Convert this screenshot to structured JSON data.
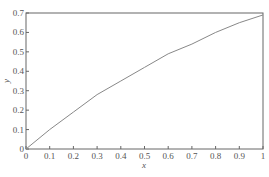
{
  "chart_data": {
    "type": "line",
    "title": "",
    "xlabel": "x",
    "ylabel": "y",
    "xlim": [
      0,
      1
    ],
    "ylim": [
      0,
      0.7
    ],
    "grid": false,
    "legend": null,
    "x_ticks": [
      "0",
      "0.1",
      "0.2",
      "0.3",
      "0.4",
      "0.5",
      "0.6",
      "0.7",
      "0.8",
      "0.9",
      "1"
    ],
    "y_ticks": [
      "0",
      "0.1",
      "0.2",
      "0.3",
      "0.4",
      "0.5",
      "0.6",
      "0.7"
    ],
    "series": [
      {
        "name": "y",
        "x": [
          0,
          0.1,
          0.2,
          0.3,
          0.4,
          0.5,
          0.6,
          0.7,
          0.8,
          0.9,
          1.0
        ],
        "values": [
          0,
          0.1,
          0.19,
          0.28,
          0.35,
          0.42,
          0.49,
          0.54,
          0.6,
          0.65,
          0.69
        ]
      }
    ],
    "colors": {
      "axis": "#666666",
      "line": "#888888"
    }
  },
  "caption": ""
}
